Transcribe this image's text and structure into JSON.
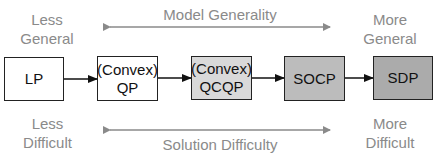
{
  "top": {
    "left_label": [
      "Less",
      "General"
    ],
    "center_label": "Model Generality",
    "right_label": [
      "More",
      "General"
    ]
  },
  "bottom": {
    "left_label": [
      "Less",
      "Difficult"
    ],
    "center_label": "Solution Difficulty",
    "right_label": [
      "More",
      "Difficult"
    ]
  },
  "boxes": [
    {
      "lines": [
        "LP"
      ],
      "fill": "#ffffff"
    },
    {
      "lines": [
        "(Convex)",
        "QP"
      ],
      "fill": "#ffffff"
    },
    {
      "lines": [
        "(Convex)",
        "QCQP"
      ],
      "fill": "#d9d9d9"
    },
    {
      "lines": [
        "SOCP"
      ],
      "fill": "#bcbcbc"
    },
    {
      "lines": [
        "SDP"
      ],
      "fill": "#ababab"
    }
  ],
  "colors": {
    "label": "#8a8a8a",
    "arrow": "#8a8a8a",
    "box_border": "#222222"
  }
}
